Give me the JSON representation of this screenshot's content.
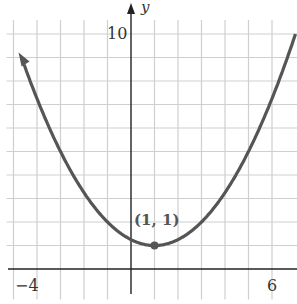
{
  "chart_data": {
    "type": "line",
    "title": "",
    "function": "y = (1/4)(x - 1)^2 + 1",
    "xlabel": "",
    "ylabel": "y",
    "xlim": [
      -5.3,
      7.0
    ],
    "ylim": [
      -1.5,
      11.3
    ],
    "x_ticks_labeled": [
      {
        "value": -4,
        "label": "−4"
      },
      {
        "value": 6,
        "label": "6"
      }
    ],
    "y_ticks_labeled": [
      {
        "value": 10,
        "label": "10"
      }
    ],
    "grid": true,
    "grid_step": 1,
    "series": [
      {
        "name": "parabola",
        "x": [
          -4.7,
          -4,
          -3,
          -2,
          -1,
          0,
          1,
          2,
          3,
          4,
          5,
          6,
          6.9
        ],
        "values": [
          9.12,
          7.25,
          5.0,
          3.25,
          2.0,
          1.25,
          1.0,
          1.25,
          2.0,
          3.25,
          5.0,
          7.25,
          9.7
        ]
      }
    ],
    "annotations": [
      {
        "x": 1,
        "y": 1,
        "text": "(1, 1)",
        "marker": "dot"
      }
    ],
    "colors": {
      "curve": "#555555",
      "grid": "#cfcfcf",
      "axis": "#222222"
    }
  },
  "labels": {
    "y_axis": "y",
    "y_tick_10": "10",
    "x_tick_neg4": "−4",
    "x_tick_6": "6",
    "vertex": "(1, 1)"
  }
}
